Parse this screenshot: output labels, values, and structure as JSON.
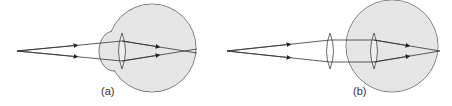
{
  "figure": {
    "panels": [
      {
        "id": "a",
        "label": "(a)",
        "description": "Myopic eye: parallel-diverging rays focus in front of the retina"
      },
      {
        "id": "b",
        "label": "(b)",
        "description": "Myopia corrected with a lens in front of the eye: rays focus on the retina"
      }
    ],
    "colors": {
      "eyeball_fill": "#e6e6e6",
      "stroke": "#444444",
      "ray": "#333333"
    }
  }
}
